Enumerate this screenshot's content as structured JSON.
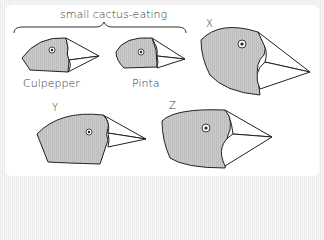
{
  "diagram": {
    "group_label": "small cactus-eating",
    "birds": [
      {
        "id": "culpepper",
        "label": "Culpepper"
      },
      {
        "id": "pinta",
        "label": "Pinta"
      },
      {
        "id": "x",
        "label": "X"
      },
      {
        "id": "y",
        "label": "Y"
      },
      {
        "id": "z",
        "label": "Z"
      }
    ],
    "colors": {
      "head_fill": "#c8c8c8",
      "outline": "#222222",
      "beak_fill": "#ffffff",
      "background": "#ffffff"
    }
  }
}
